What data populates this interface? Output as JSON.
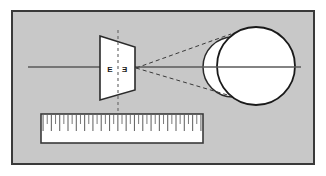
{
  "figure": {
    "title": "Optical ray diagram with trapezoidal element and spherical body",
    "alt": "Gray rectangular plate containing a trapezoidal lens marked E E on an optical axis, dashed rays converging to two overlapping circles, and a ruler scale below",
    "panel": {
      "background_color": "#c8c8c8",
      "border_color": "#3a3a3a",
      "x": 12,
      "y": 11,
      "width": 302,
      "height": 153
    },
    "page_background_color": "#ffffff"
  },
  "optical_axis": {
    "name": "optical-axis-line",
    "color": "#5a5a5a",
    "x_start": 28,
    "x_end": 301,
    "y": 67
  },
  "dashed_vertical_axis": {
    "name": "principal-plane-dashed-line",
    "color": "#6e6e6e",
    "x": 118,
    "y_top": 30,
    "y_bottom": 111,
    "dash": "3 3"
  },
  "trapezoid": {
    "name": "trapezoidal-optical-element",
    "fill": "#ffffff",
    "stroke": "#2b2b2b",
    "points": "100,36 135,47 135,90 100,100",
    "labels": [
      {
        "text": "E",
        "x": 110,
        "y": 70
      },
      {
        "text": "E",
        "x": 124,
        "y": 70
      }
    ]
  },
  "rays": [
    {
      "name": "upper-converging-ray",
      "x1": 136,
      "y1": 68,
      "x2": 231,
      "y2": 34,
      "color": "#3a3a3a",
      "dash": "4 3"
    },
    {
      "name": "lower-converging-ray",
      "x1": 136,
      "y1": 68,
      "x2": 231,
      "y2": 96,
      "color": "#3a3a3a",
      "dash": "4 3"
    }
  ],
  "circles": [
    {
      "name": "small-circle-rear",
      "cx": 233,
      "cy": 67,
      "r": 30,
      "fill": "#ffffff",
      "stroke": "#2b2b2b"
    },
    {
      "name": "large-circle-front",
      "cx": 256,
      "cy": 66,
      "r": 39,
      "fill": "#ffffff",
      "stroke": "#1a1a1a"
    }
  ],
  "ruler": {
    "name": "ruler-scale",
    "x": 41,
    "y": 114,
    "width": 162,
    "height": 29,
    "fill": "#ffffff",
    "stroke": "#3a3a3a",
    "tick_color": "#6a6a6a",
    "tick_count": 39,
    "major_tick_length": 16,
    "minor_tick_length": 9,
    "major_every": 2
  }
}
